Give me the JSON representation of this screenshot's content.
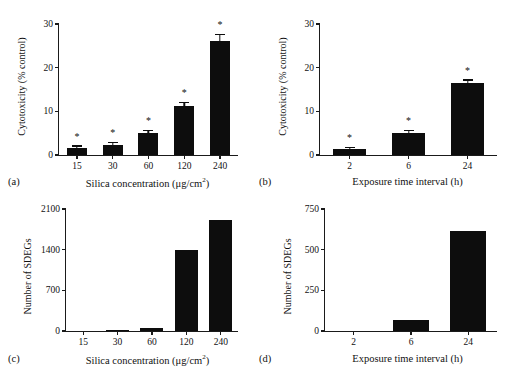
{
  "figure": {
    "background": "#ffffff",
    "bar_color": "#0d0d0d",
    "axis_color": "#1a1a1a"
  },
  "panels": {
    "a": {
      "tag": "(a)",
      "ylabel": "Cytotoxicity (% control)",
      "xlabel_main": "Silica concentration (μg/cm",
      "xlabel_sup": "2",
      "xlabel_tail": ")",
      "yticks": [
        "0",
        "10",
        "20",
        "30"
      ],
      "xticks": [
        "15",
        "30",
        "60",
        "120",
        "240"
      ]
    },
    "b": {
      "tag": "(b)",
      "ylabel": "Cytotoxicity (% control)",
      "xlabel_main": "Exposure time interval (h)",
      "yticks": [
        "0",
        "10",
        "20",
        "30"
      ],
      "xticks": [
        "2",
        "6",
        "24"
      ]
    },
    "c": {
      "tag": "(c)",
      "ylabel": "Number of SDEGs",
      "xlabel_main": "Silica concentration (μg/cm",
      "xlabel_sup": "2",
      "xlabel_tail": ")",
      "yticks": [
        "0",
        "700",
        "1400",
        "2100"
      ],
      "xticks": [
        "15",
        "30",
        "60",
        "120",
        "240"
      ]
    },
    "d": {
      "tag": "(d)",
      "ylabel": "Number of SDEGs",
      "xlabel_main": "Exposure time interval (h)",
      "yticks": [
        "0",
        "250",
        "500",
        "750"
      ],
      "xticks": [
        "2",
        "6",
        "24"
      ]
    }
  },
  "chart_data": [
    {
      "panel": "a",
      "type": "bar",
      "title": "",
      "xlabel": "Silica concentration (μg/cm2)",
      "ylabel": "Cytotoxicity (% control)",
      "categories": [
        "15",
        "30",
        "60",
        "120",
        "240"
      ],
      "values": [
        1.6,
        2.4,
        5.1,
        11.3,
        26.0
      ],
      "errors": [
        0.3,
        0.35,
        0.4,
        0.6,
        1.5
      ],
      "significance": [
        "*",
        "*",
        "*",
        "*",
        "*"
      ],
      "ylim": [
        0,
        30
      ],
      "yticks": [
        0,
        10,
        20,
        30
      ],
      "grid": false,
      "legend": "none"
    },
    {
      "panel": "b",
      "type": "bar",
      "title": "",
      "xlabel": "Exposure time interval (h)",
      "ylabel": "Cytotoxicity (% control)",
      "categories": [
        "2",
        "6",
        "24"
      ],
      "values": [
        1.3,
        5.1,
        16.4
      ],
      "errors": [
        0.2,
        0.35,
        0.6
      ],
      "significance": [
        "*",
        "*",
        "*"
      ],
      "ylim": [
        0,
        30
      ],
      "yticks": [
        0,
        10,
        20,
        30
      ],
      "grid": false,
      "legend": "none"
    },
    {
      "panel": "c",
      "type": "bar",
      "title": "",
      "xlabel": "Silica concentration (μg/cm2)",
      "ylabel": "Number of SDEGs",
      "categories": [
        "15",
        "30",
        "60",
        "120",
        "240"
      ],
      "values": [
        0,
        12,
        55,
        1390,
        1910
      ],
      "errors": [
        0,
        0,
        0,
        0,
        0
      ],
      "significance": [
        "",
        "",
        "",
        "",
        ""
      ],
      "ylim": [
        0,
        2100
      ],
      "yticks": [
        0,
        700,
        1400,
        2100
      ],
      "grid": false,
      "legend": "none"
    },
    {
      "panel": "d",
      "type": "bar",
      "title": "",
      "xlabel": "Exposure time interval (h)",
      "ylabel": "Number of SDEGs",
      "categories": [
        "2",
        "6",
        "24"
      ],
      "values": [
        0,
        65,
        615
      ],
      "errors": [
        0,
        0,
        0
      ],
      "significance": [
        "",
        "",
        ""
      ],
      "ylim": [
        0,
        750
      ],
      "yticks": [
        0,
        250,
        500,
        750
      ],
      "grid": false,
      "legend": "none"
    }
  ]
}
